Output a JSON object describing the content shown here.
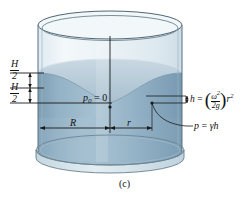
{
  "figure": {
    "caption": "(c)",
    "kind": "rotating-cylinder-free-surface-paraboloid",
    "colors": {
      "glass_outline": "#5a6e7d",
      "glass_fill": "#eaf1f5",
      "water_body": "#89a9bf",
      "water_body_dark": "#7e9fb6",
      "water_surface": "#b9ccd8",
      "water_surface_light": "#c5d6e0",
      "rim_light": "#dfe9ef",
      "line": "#1a1a1a",
      "text": "#111111"
    },
    "labels": {
      "h_half_top": {
        "num": "H",
        "den": "2"
      },
      "h_half_bottom": {
        "num": "H",
        "den": "2"
      },
      "p0": {
        "symbol": "p",
        "subscript": "0",
        "equals": "= 0"
      },
      "radius_R": "R",
      "radius_r": "r",
      "h_formula": {
        "lhs": "h",
        "equals": "=",
        "omega": "ω",
        "omega_exp": "2",
        "denominator_two_g": "2g",
        "r": "r",
        "r_exp": "2",
        "plain": "h = (ω²/2g)r²"
      },
      "p_formula": {
        "p": "p",
        "equals": "=",
        "gamma": "γ",
        "h": "h",
        "plain": "p = γh"
      }
    }
  }
}
